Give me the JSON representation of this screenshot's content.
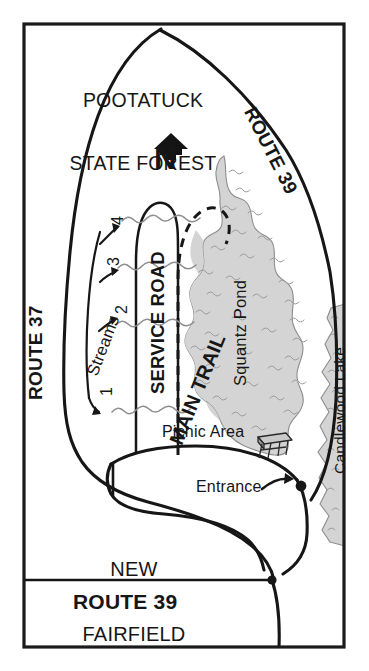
{
  "map": {
    "title_region_top": "POOTATUCK\nSTATE FOREST",
    "labels": {
      "pootatuck_line1": "POOTATUCK",
      "pootatuck_line2": "STATE FOREST",
      "new_fairfield_line1": "NEW",
      "new_fairfield_line2": "FAIRFIELD",
      "route_39_top": "ROUTE 39",
      "route_39_bottom": "ROUTE 39",
      "route_37": "ROUTE 37",
      "service_road": "SERVICE ROAD",
      "main_trail": "MAIN TRAIL",
      "squantz_pond": "Squantz Pond",
      "candlewood_lake": "Candlewood Lake",
      "picnic_area": "Picnic Area",
      "entrance": "Entrance",
      "streams": "Streams",
      "north": "N"
    },
    "stream_numbers": [
      "1",
      "2",
      "3",
      "4"
    ],
    "icons": {
      "north_arrow": "north-arrow-icon",
      "picnic_table": "picnic-table-icon",
      "entrance_marker": "entrance-dot-icon",
      "entrance_arrow": "curved-arrow-icon"
    },
    "colors": {
      "ink": "#161616",
      "water_fill": "#d4d4d4",
      "water_stroke": "#8c8c8c",
      "water_mark": "#9a9a9a",
      "paper": "#ffffff",
      "frame": "#1a1a1a"
    },
    "features": [
      {
        "name": "Squantz Pond",
        "type": "water"
      },
      {
        "name": "Candlewood Lake",
        "type": "water"
      },
      {
        "name": "Pootatuck State Forest",
        "type": "forest"
      },
      {
        "name": "New Fairfield",
        "type": "town"
      },
      {
        "name": "Main Trail",
        "type": "trail",
        "style": "dashed"
      },
      {
        "name": "Service Road",
        "type": "road"
      },
      {
        "name": "Route 39",
        "type": "highway"
      },
      {
        "name": "Route 37",
        "type": "highway"
      },
      {
        "name": "Picnic Area",
        "type": "amenity"
      },
      {
        "name": "Entrance",
        "type": "access-point"
      },
      {
        "name": "Streams",
        "type": "hydrology",
        "count": 4
      }
    ]
  }
}
